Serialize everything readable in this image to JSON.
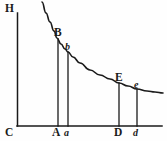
{
  "figure": {
    "background_color": "#fefefe",
    "ink_color": "#1a1a1a"
  },
  "axes": {
    "vertical_axis_name": "HC",
    "horizontal_axis_name": "C-baseline",
    "origin_label": "C"
  },
  "labels": {
    "h": "H",
    "c": "C",
    "a_cap": "A",
    "a_small": "a",
    "b_cap": "B",
    "b_small": "b",
    "d_cap": "D",
    "d_small": "d",
    "e_cap": "E",
    "e_small": "e"
  },
  "chart_data": {
    "type": "line",
    "xlabel": "",
    "ylabel": "",
    "grid": false,
    "legend": "none",
    "xlim": [
      17,
      165
    ],
    "ylim": [
      126,
      0
    ],
    "series": [
      {
        "name": "hyperbola-curve",
        "x": [
          42,
          46,
          50,
          54,
          57,
          61,
          65,
          68,
          73,
          80,
          90,
          100,
          110,
          119,
          128,
          137,
          147,
          155,
          163
        ],
        "y": [
          2,
          13,
          22,
          31,
          38,
          44,
          49,
          52,
          57,
          63,
          70,
          75,
          79,
          83,
          86,
          89,
          91,
          92,
          93
        ]
      }
    ],
    "ordinates": [
      {
        "name": "AB",
        "foot_label": "A",
        "top_label": "B",
        "x": 58,
        "y_top": 39,
        "y_bottom": 126
      },
      {
        "name": "ab",
        "foot_label": "a",
        "top_label": "b",
        "x": 68,
        "y_top": 52,
        "y_bottom": 126
      },
      {
        "name": "DE",
        "foot_label": "D",
        "top_label": "E",
        "x": 119,
        "y_top": 83,
        "y_bottom": 126
      },
      {
        "name": "de",
        "foot_label": "d",
        "top_label": "e",
        "x": 137,
        "y_top": 89,
        "y_bottom": 126
      }
    ],
    "axis_lines": [
      {
        "name": "vertical-axis-HC",
        "x1": 17.5,
        "y1": 13,
        "x2": 17.5,
        "y2": 126
      },
      {
        "name": "horizontal-axis-C",
        "x1": 17,
        "y1": 126,
        "x2": 162,
        "y2": 126
      }
    ]
  }
}
